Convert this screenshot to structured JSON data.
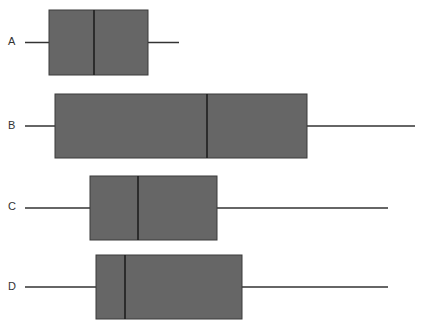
{
  "chart_data": {
    "type": "boxplot",
    "orientation": "horizontal",
    "title": "",
    "xlabel": "",
    "ylabel": "",
    "grid": false,
    "legend": null,
    "categories": [
      "A",
      "B",
      "C",
      "D"
    ],
    "series": [
      {
        "name": "A",
        "whisker_low": 25,
        "q1": 49,
        "median": 94,
        "q3": 148,
        "whisker_high": 179
      },
      {
        "name": "B",
        "whisker_low": 25,
        "q1": 55,
        "median": 207,
        "q3": 307,
        "whisker_high": 415
      },
      {
        "name": "C",
        "whisker_low": 25,
        "q1": 90,
        "median": 138,
        "q3": 217,
        "whisker_high": 388
      },
      {
        "name": "D",
        "whisker_low": 25,
        "q1": 96,
        "median": 125,
        "q3": 242,
        "whisker_high": 388
      }
    ],
    "units_note": "values expressed in horizontal pixel positions (no axis ticks shown)"
  },
  "style": {
    "box_fill": "#666666",
    "box_stroke": "#3a3a3a",
    "median_color": "#1a1a1a",
    "whisker_color": "#333333",
    "label_color": "#333333"
  },
  "labels": {
    "A": "A",
    "B": "B",
    "C": "C",
    "D": "D"
  }
}
